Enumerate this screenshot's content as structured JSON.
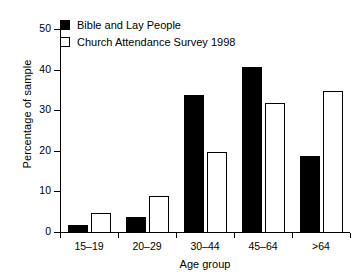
{
  "chart_data": {
    "type": "bar",
    "title": "",
    "xlabel": "Age group",
    "ylabel": "Percentage of sample",
    "categories": [
      "15–19",
      "20–29",
      "30–44",
      "45–64",
      ">64"
    ],
    "series": [
      {
        "name": "Bible and Lay People",
        "values": [
          2,
          4,
          34,
          41,
          19
        ],
        "color": "#000000",
        "style": "filled"
      },
      {
        "name": "Church Attendance Survey 1998",
        "values": [
          5,
          9,
          20,
          32,
          35
        ],
        "color": "#ffffff",
        "style": "hollow"
      }
    ],
    "ylim": [
      0,
      52
    ],
    "yticks": [
      0,
      10,
      20,
      30,
      40,
      50
    ],
    "ytick_labels": [
      "0",
      "10",
      "20",
      "30",
      "40",
      "50"
    ],
    "grid": false,
    "legend_position": "top-left"
  },
  "legend": {
    "items": [
      {
        "label": "Bible and Lay People",
        "swatch": "filled-square-icon"
      },
      {
        "label": "Church Attendance Survey 1998",
        "swatch": "hollow-square-icon"
      }
    ]
  }
}
